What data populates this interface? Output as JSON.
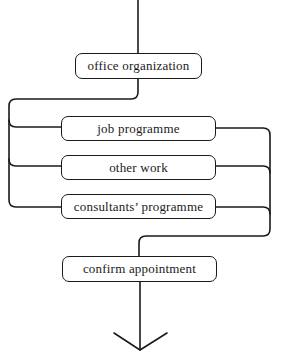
{
  "diagram": {
    "type": "flowchart",
    "nodes": {
      "office_organization": "office organization",
      "job_programme": "job programme",
      "other_work": "other work",
      "consultants_programme": "consultants’ programme",
      "confirm_appointment": "confirm appointment"
    },
    "edges": [
      {
        "from": "start",
        "to": "office_organization"
      },
      {
        "from": "office_organization",
        "to": "job_programme"
      },
      {
        "from": "office_organization",
        "to": "other_work"
      },
      {
        "from": "office_organization",
        "to": "consultants_programme"
      },
      {
        "from": "job_programme",
        "to": "confirm_appointment"
      },
      {
        "from": "other_work",
        "to": "confirm_appointment"
      },
      {
        "from": "consultants_programme",
        "to": "confirm_appointment"
      },
      {
        "from": "confirm_appointment",
        "to": "end-arrow"
      }
    ],
    "colors": {
      "line": "#1a1a1a",
      "background": "#ffffff"
    }
  }
}
